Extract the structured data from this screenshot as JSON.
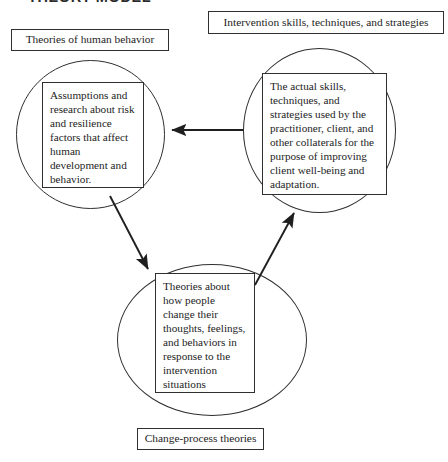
{
  "document": {
    "title": "THEORY MODEL"
  },
  "diagram": {
    "type": "cycle-diagram",
    "node_count": 3,
    "captions": {
      "left": "Theories of human behavior",
      "right": "Intervention skills, techniques, and strategies",
      "bottom": "Change-process theories"
    },
    "nodes": [
      {
        "id": "human-behavior",
        "position": "left",
        "caption": "Theories of human behavior",
        "body": "Assumptions and research about risk and resilience factors that affect human development and behavior."
      },
      {
        "id": "intervention-skills",
        "position": "right",
        "caption": "Intervention skills, techniques, and strategies",
        "body": "The actual skills, techniques, and strategies used by the practitioner, client, and other collaterals for the purpose of improving client well-being and adaptation."
      },
      {
        "id": "change-process",
        "position": "bottom",
        "caption": "Change-process theories",
        "body": "Theories about how people change their thoughts, feelings, and behaviors in response to the intervention situations"
      }
    ],
    "arrows": [
      {
        "id": "right-to-left",
        "from": "intervention-skills",
        "to": "human-behavior",
        "direction": "horizontal-left"
      },
      {
        "id": "left-to-bottom",
        "from": "human-behavior",
        "to": "change-process",
        "direction": "diagonal-down-right"
      },
      {
        "id": "bottom-to-right",
        "from": "change-process",
        "to": "intervention-skills",
        "direction": "diagonal-up-right"
      }
    ],
    "colors": {
      "stroke": "#2f2f2f",
      "text": "#1d1d1d",
      "background": "#ffffff"
    }
  }
}
